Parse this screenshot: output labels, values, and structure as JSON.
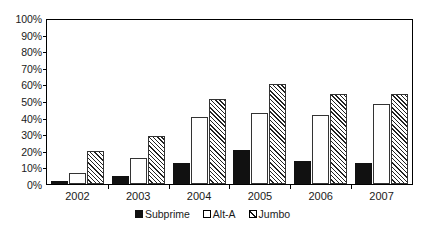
{
  "chart_data": {
    "type": "bar",
    "title": "",
    "subtitle": "",
    "xlabel": "",
    "ylabel": "",
    "categories": [
      "2002",
      "2003",
      "2004",
      "2005",
      "2006",
      "2007"
    ],
    "series": [
      {
        "name": "Subprime",
        "values": [
          2,
          5,
          13,
          21,
          14,
          13
        ],
        "fill": "solid-black",
        "color": "#111111"
      },
      {
        "name": "Alt-A",
        "values": [
          7,
          16,
          41,
          43,
          42,
          49
        ],
        "fill": "white",
        "color": "#ffffff"
      },
      {
        "name": "Jumbo",
        "values": [
          20,
          29,
          52,
          61,
          55,
          55
        ],
        "fill": "diagonal-hatch",
        "color": "#222222"
      }
    ],
    "ylim": [
      0,
      100
    ],
    "ytick_values": [
      0,
      10,
      20,
      30,
      40,
      50,
      60,
      70,
      80,
      90,
      100
    ],
    "ytick_labels": [
      "0%",
      "10%",
      "20%",
      "30%",
      "40%",
      "50%",
      "60%",
      "70%",
      "80%",
      "90%",
      "100%"
    ],
    "yunit": "%",
    "grid": false,
    "legend_position": "bottom-center",
    "legend_entries": [
      "Subprime",
      "Alt-A",
      "Jumbo"
    ],
    "annotations": []
  },
  "axes": {
    "y_ticks": [
      {
        "label": "100%",
        "value": 100
      },
      {
        "label": "90%",
        "value": 90
      },
      {
        "label": "80%",
        "value": 80
      },
      {
        "label": "70%",
        "value": 70
      },
      {
        "label": "60%",
        "value": 60
      },
      {
        "label": "50%",
        "value": 50
      },
      {
        "label": "40%",
        "value": 40
      },
      {
        "label": "30%",
        "value": 30
      },
      {
        "label": "20%",
        "value": 20
      },
      {
        "label": "10%",
        "value": 10
      },
      {
        "label": "0%",
        "value": 0
      }
    ],
    "x_ticks": [
      "2002",
      "2003",
      "2004",
      "2005",
      "2006",
      "2007"
    ]
  },
  "legend": {
    "items": [
      {
        "label": "Subprime",
        "swatch": "solid-square-icon"
      },
      {
        "label": "Alt-A",
        "swatch": "empty-square-icon"
      },
      {
        "label": "Jumbo",
        "swatch": "hatched-square-icon"
      }
    ]
  }
}
